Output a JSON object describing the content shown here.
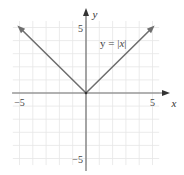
{
  "chart_data": {
    "type": "line",
    "title": "",
    "xlabel": "x",
    "ylabel": "y",
    "xlim": [
      -5.5,
      5.5
    ],
    "ylim": [
      -5.5,
      5.5
    ],
    "grid": true,
    "grid_step": 1,
    "x_ticks": [
      {
        "value": -5,
        "label": "−5"
      },
      {
        "value": 5,
        "label": "5"
      }
    ],
    "y_ticks": [
      {
        "value": 5,
        "label": "5"
      },
      {
        "value": -5,
        "label": "−5"
      }
    ],
    "series": [
      {
        "name": "y = |x|",
        "points": [
          [
            -5,
            5
          ],
          [
            0,
            0
          ],
          [
            5,
            5
          ]
        ],
        "arrows": "both-ends",
        "color": "#6e6e6e"
      }
    ],
    "annotations": [
      {
        "text_plain": "y = ",
        "text_italic": "x",
        "x": 1.5,
        "y": 4.3
      }
    ],
    "colors": {
      "grid": "#e6e6e6",
      "axis": "#6e6e6e",
      "curve": "#6e6e6e"
    }
  }
}
